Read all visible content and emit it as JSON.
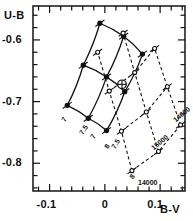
{
  "chart_data": {
    "type": "scatter",
    "title": "",
    "xlabel": "B-V",
    "ylabel": "U-B",
    "xlim": [
      -0.13,
      0.145
    ],
    "ylim": [
      -0.845,
      -0.545
    ],
    "grid": false,
    "legend_position": "none",
    "x_ticks_labeled": [
      "-0.1",
      "0",
      "0.1"
    ],
    "x_tick_values": [
      -0.1,
      0.0,
      0.1
    ],
    "x_minor_step": 0.02,
    "y_ticks_labeled": [
      "-0.8",
      "-0.7",
      "-0.6"
    ],
    "y_tick_values": [
      -0.8,
      -0.7,
      -0.6
    ],
    "y_minor_step": 0.02,
    "annotations": [
      {
        "name": "earth-symbol",
        "symbol": "⊕",
        "x": 0.031,
        "y": -0.672,
        "note": "observed position marker"
      }
    ],
    "series": [
      {
        "name": "gravity-grid",
        "style": "solid",
        "marker": "filled-circle",
        "label_prefix": "log g",
        "lines": [
          {
            "label": "7",
            "points": [
              [
                -0.068,
                -0.706
              ],
              [
                -0.039,
                -0.641
              ],
              [
                -0.009,
                -0.573
              ]
            ]
          },
          {
            "label": "7.5",
            "points": [
              [
                -0.03,
                -0.727
              ],
              [
                0.003,
                -0.66
              ],
              [
                0.034,
                -0.594
              ]
            ]
          },
          {
            "label": "8",
            "points": [
              [
                0.003,
                -0.747
              ],
              [
                0.036,
                -0.684
              ],
              [
                0.068,
                -0.623
              ]
            ]
          }
        ],
        "cross_lines": [
          {
            "points": [
              [
                -0.068,
                -0.706
              ],
              [
                -0.03,
                -0.727
              ],
              [
                0.003,
                -0.747
              ]
            ]
          },
          {
            "points": [
              [
                -0.039,
                -0.641
              ],
              [
                0.003,
                -0.66
              ],
              [
                0.036,
                -0.684
              ]
            ]
          },
          {
            "points": [
              [
                -0.009,
                -0.573
              ],
              [
                0.034,
                -0.594
              ],
              [
                0.068,
                -0.623
              ]
            ]
          }
        ],
        "labels": [
          {
            "text": "7",
            "x": -0.082,
            "y": -0.728,
            "rotate": -58
          },
          {
            "text": "7.5",
            "x": -0.049,
            "y": -0.749,
            "rotate": -58
          },
          {
            "text": "7",
            "x": -0.028,
            "y": -0.755,
            "rotate": -58
          },
          {
            "text": "8",
            "x": -0.004,
            "y": -0.772,
            "rotate": -58
          },
          {
            "text": "7.5",
            "x": 0.01,
            "y": -0.772,
            "rotate": -58
          }
        ]
      },
      {
        "name": "temperature-grid",
        "style": "dashed",
        "marker": "open-circle",
        "label_suffix": "K",
        "lines": [
          {
            "label": "14000",
            "points": [
              [
                0.049,
                -0.812
              ],
              [
                0.03,
                -0.748
              ],
              [
                0.008,
                -0.683
              ],
              [
                -0.013,
                -0.62
              ]
            ]
          },
          {
            "label": "15000",
            "points": [
              [
                0.097,
                -0.781
              ],
              [
                0.075,
                -0.717
              ],
              [
                0.054,
                -0.653
              ],
              [
                0.033,
                -0.589
              ]
            ]
          },
          {
            "label": "16000",
            "points": [
              [
                0.137,
                -0.738
              ],
              [
                0.113,
                -0.676
              ],
              [
                0.09,
                -0.614
              ]
            ]
          }
        ],
        "cross_lines": [
          {
            "points": [
              [
                0.049,
                -0.812
              ],
              [
                0.097,
                -0.781
              ],
              [
                0.137,
                -0.738
              ]
            ]
          },
          {
            "points": [
              [
                0.03,
                -0.748
              ],
              [
                0.075,
                -0.717
              ],
              [
                0.113,
                -0.676
              ]
            ]
          },
          {
            "points": [
              [
                0.008,
                -0.683
              ],
              [
                0.054,
                -0.653
              ],
              [
                0.09,
                -0.614
              ]
            ]
          }
        ],
        "labels": [
          {
            "text": "14000",
            "x": 0.06,
            "y": -0.825,
            "rotate": 0
          },
          {
            "text": "15000",
            "x": 0.082,
            "y": -0.772,
            "rotate": -40
          },
          {
            "text": "14000",
            "x": 0.121,
            "y": -0.727,
            "rotate": -40
          },
          {
            "text": "8",
            "x": 0.041,
            "y": -0.82,
            "rotate": -55
          }
        ]
      }
    ]
  },
  "axes": {
    "x_label": "B-V",
    "y_label": "U-B",
    "x_tick_labels": [
      "-0.1",
      "0",
      "0.1"
    ],
    "y_tick_labels": [
      "-0.8",
      "-0.7",
      "-0.6"
    ]
  },
  "colors": {
    "ink": "#111111",
    "frame": "#222222",
    "background": "#ffffff"
  }
}
